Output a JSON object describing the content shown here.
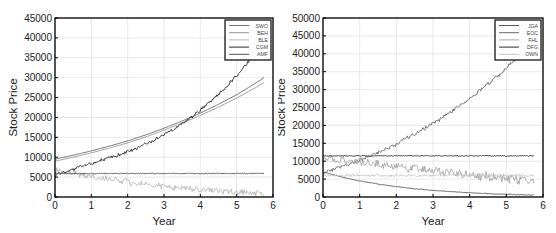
{
  "chart_data": [
    {
      "type": "line",
      "title": "",
      "xlabel": "Year",
      "ylabel": "Stock Price",
      "xlim": [
        0,
        6
      ],
      "ylim": [
        0,
        45000
      ],
      "xticks": [
        0,
        1,
        2,
        3,
        4,
        5,
        6
      ],
      "yticks": [
        0,
        5000,
        10000,
        15000,
        20000,
        25000,
        30000,
        35000,
        40000,
        45000
      ],
      "grid": true,
      "legend_position": "upper right",
      "x": [
        0,
        0.5,
        1,
        1.5,
        2,
        2.5,
        3,
        3.5,
        4,
        4.5,
        5,
        5.5,
        5.75
      ],
      "series": [
        {
          "name": "SWO",
          "color": "#6e6e6e",
          "noise": 0,
          "values": [
            9500,
            10500,
            11600,
            12800,
            14100,
            15600,
            17300,
            19100,
            21100,
            23300,
            25700,
            28500,
            30000
          ]
        },
        {
          "name": "BEH",
          "color": "#9a9a9a",
          "noise": 0,
          "values": [
            9000,
            10000,
            11100,
            12300,
            13600,
            15100,
            16800,
            18600,
            20500,
            22600,
            24900,
            27400,
            28800
          ]
        },
        {
          "name": "BLE",
          "color": "#b8b8b8",
          "noise": 900,
          "values": [
            7000,
            6000,
            5200,
            4500,
            3800,
            3200,
            2600,
            2200,
            1800,
            1500,
            1200,
            1000,
            900
          ]
        },
        {
          "name": "CGM",
          "color": "#2a2a2a",
          "noise": 500,
          "values": [
            5500,
            7000,
            8400,
            9800,
            11300,
            13300,
            15600,
            18500,
            21800,
            25800,
            30500,
            36000,
            39500
          ]
        },
        {
          "name": "AMF",
          "color": "#555555",
          "noise": 120,
          "values": [
            5900,
            5900,
            5900,
            5900,
            5900,
            5900,
            5900,
            5900,
            5900,
            5900,
            5900,
            5900,
            5900
          ]
        }
      ]
    },
    {
      "type": "line",
      "title": "",
      "xlabel": "Year",
      "ylabel": "Stock Price",
      "xlim": [
        0,
        6
      ],
      "ylim": [
        0,
        50000
      ],
      "xticks": [
        0,
        1,
        2,
        3,
        4,
        5,
        6
      ],
      "yticks": [
        0,
        5000,
        10000,
        15000,
        20000,
        25000,
        30000,
        35000,
        40000,
        45000,
        50000
      ],
      "grid": true,
      "legend_position": "upper right",
      "x": [
        0,
        0.5,
        1,
        1.5,
        2,
        2.5,
        3,
        3.5,
        4,
        4.5,
        5,
        5.5,
        5.75
      ],
      "series": [
        {
          "name": "JGA",
          "color": "#555555",
          "noise": 100,
          "values": [
            7000,
            5600,
            4500,
            3600,
            2900,
            2300,
            1850,
            1500,
            1200,
            950,
            750,
            600,
            550
          ]
        },
        {
          "name": "EOC",
          "color": "#6a6a6a",
          "noise": 600,
          "values": [
            6500,
            8500,
            10200,
            12300,
            14800,
            17700,
            20500,
            23800,
            27500,
            31500,
            36000,
            41000,
            44000
          ]
        },
        {
          "name": "FHL",
          "color": "#a8a8a8",
          "noise": 1500,
          "values": [
            11000,
            10500,
            9800,
            9200,
            8600,
            8000,
            7400,
            6800,
            6200,
            5700,
            5200,
            4800,
            4600
          ]
        },
        {
          "name": "DFG",
          "color": "#2e2e2e",
          "noise": 150,
          "values": [
            11500,
            11500,
            11500,
            11500,
            11500,
            11500,
            11500,
            11500,
            11500,
            11500,
            11500,
            11500,
            11500
          ]
        },
        {
          "name": "OWN",
          "color": "#c4c4c4",
          "noise": 400,
          "values": [
            6000,
            6000,
            6000,
            6000,
            6000,
            6000,
            6000,
            6000,
            6000,
            6000,
            6000,
            6000,
            6000
          ]
        }
      ]
    }
  ]
}
